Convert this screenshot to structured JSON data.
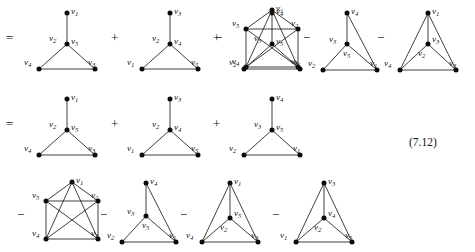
{
  "figure": {
    "equation_number": "(7.12)",
    "operators": {
      "equals": "=",
      "plus": "+",
      "minus": "−"
    },
    "vertex_labels": {
      "v1": "v",
      "v1s": "1",
      "v2": "v",
      "v2s": "2",
      "v3": "v",
      "v3s": "3",
      "v4": "v",
      "v4s": "4",
      "v5": "v",
      "v5s": "5"
    }
  },
  "rows": [
    {
      "id": "row-1",
      "lead_operator": "=",
      "terms": [
        {
          "operator": "",
          "graph": "triangle-with-pendant",
          "labels": [
            "v1",
            "v2",
            "v5",
            "v4",
            "v3"
          ]
        },
        {
          "operator": "+",
          "graph": "triangle-with-pendant",
          "labels": [
            "v3",
            "v2",
            "v4",
            "v1",
            "v5"
          ]
        },
        {
          "operator": "+",
          "graph": "triangle-with-pendant",
          "labels": [
            "v4",
            "v3",
            "v5",
            "v2",
            "v1"
          ]
        },
        {
          "operator": "−",
          "graph": "k5-square",
          "labels": [
            "v1",
            "v5",
            "v2",
            "v4",
            "v3"
          ]
        },
        {
          "operator": "−",
          "graph": "kite-inner",
          "labels": [
            "v4",
            "v3",
            "v5",
            "v2",
            "v1"
          ]
        },
        {
          "operator": "−",
          "graph": "kite-inner-tall",
          "labels": [
            "v1",
            "v3",
            "v2",
            "v4",
            "v3b"
          ]
        }
      ]
    },
    {
      "id": "row-2",
      "lead_operator": "=",
      "terms": [
        {
          "operator": "",
          "graph": "triangle-with-pendant",
          "labels": [
            "v1",
            "v2",
            "v5",
            "v4",
            "v3"
          ]
        },
        {
          "operator": "+",
          "graph": "triangle-with-pendant",
          "labels": [
            "v3",
            "v2",
            "v4",
            "v1",
            "v5"
          ]
        },
        {
          "operator": "+",
          "graph": "triangle-with-pendant",
          "labels": [
            "v4",
            "v3",
            "v5",
            "v2",
            "v1"
          ]
        }
      ]
    },
    {
      "id": "row-3",
      "lead_operator": "−",
      "terms": [
        {
          "operator": "−",
          "graph": "k5-square",
          "labels": [
            "v1",
            "v5",
            "v2",
            "v4",
            "v3"
          ]
        },
        {
          "operator": "−",
          "graph": "kite-inner",
          "labels": [
            "v4",
            "v3",
            "v5",
            "v2",
            "v1"
          ]
        },
        {
          "operator": "−",
          "graph": "kite-inner-tall",
          "labels": [
            "v1",
            "v5",
            "v2",
            "v4",
            "v3"
          ]
        },
        {
          "operator": "−",
          "graph": "kite-inner-tall",
          "labels": [
            "v3",
            "v4",
            "v2",
            "v1",
            "v5"
          ]
        }
      ]
    }
  ],
  "labels_by_position": {
    "r1g1": {
      "top": "1",
      "centerleft": "2",
      "centerright": "5",
      "bottomleft": "4",
      "bottomright": "3"
    },
    "r1g2": {
      "top": "3",
      "centerleft": "2",
      "centerright": "4",
      "bottomleft": "1",
      "bottomright": "5"
    },
    "r1g3": {
      "top": "4",
      "centerleft": "3",
      "centerright": "5",
      "bottomleft": "2",
      "bottomright": "1"
    },
    "r1g4": {
      "top": "1",
      "upleft": "5",
      "upright": "2",
      "bottomleft": "4",
      "bottomright": "3"
    },
    "r1g5": {
      "top": "4",
      "mid": "3",
      "midlow": "5",
      "bottomleft": "2",
      "bottomright": "1"
    },
    "r1g6": {
      "top": "1",
      "mid": "3",
      "midlow": "2",
      "bottomleft": "4",
      "bottomright": "3"
    },
    "r2g1": {
      "top": "1",
      "centerleft": "2",
      "centerright": "5",
      "bottomleft": "4",
      "bottomright": "3"
    },
    "r2g2": {
      "top": "3",
      "centerleft": "2",
      "centerright": "4",
      "bottomleft": "1",
      "bottomright": "5"
    },
    "r2g3": {
      "top": "4",
      "centerleft": "3",
      "centerright": "5",
      "bottomleft": "2",
      "bottomright": "1"
    },
    "r3g1": {
      "top": "1",
      "upleft": "5",
      "upright": "2",
      "bottomleft": "4",
      "bottomright": "3"
    },
    "r3g2": {
      "top": "4",
      "mid": "3",
      "midlow": "5",
      "bottomleft": "2",
      "bottomright": "1"
    },
    "r3g3": {
      "top": "1",
      "mid": "5",
      "midlow": "2",
      "bottomleft": "4",
      "bottomright": "3"
    },
    "r3g4": {
      "top": "3",
      "mid": "4",
      "midlow": "2",
      "bottomleft": "1",
      "bottomright": "5"
    }
  }
}
